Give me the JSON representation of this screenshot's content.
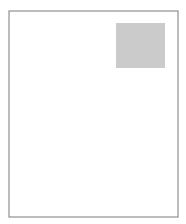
{
  "map": {
    "subject": "Arizona state outline",
    "frame": {
      "x": 9,
      "y": 11,
      "width": 169,
      "height": 206,
      "stroke": "#7a7a7a"
    },
    "state_outline": {
      "fill": "#ffffff",
      "stroke": "#333333",
      "path": "M40,21 L165,22 L166,70 L168,140 L172,203 L116,203 L18,164 L21,160 L24,157 L26,152 L24,149 L22,145 L23,139 L22,134 L24,129 L25,124 L27,120 L29,116 L31,112 L33,110 L35,108 L34,104 L31,102 L31,98 L29,95 L27,92 L25,87 L24,82 L23,78 L25,74 L24,70 L22,66 L23,61 L23,55 L24,51 L26,49 L30,48 L33,51 L36,52 L39,50 L40,46 Z"
    },
    "highlighted_region": {
      "label": "Northeast corner region",
      "x": 116,
      "y": 23,
      "width": 49,
      "height": 45,
      "fill": "#cbcbcb"
    }
  }
}
